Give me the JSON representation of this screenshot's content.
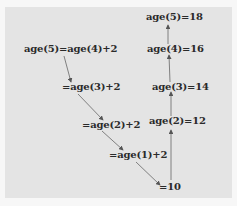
{
  "diagram": {
    "title": "",
    "left_chain": [
      {
        "id": "l1",
        "text": "age(5)=age(4)+2"
      },
      {
        "id": "l2",
        "text": "=age(3)+2"
      },
      {
        "id": "l3",
        "text": "=age(2)+2"
      },
      {
        "id": "l4",
        "text": "=age(1)+2"
      },
      {
        "id": "base",
        "text": "=10"
      }
    ],
    "right_chain": [
      {
        "id": "r2",
        "text": "age(2)=12"
      },
      {
        "id": "r3",
        "text": "age(3)=14"
      },
      {
        "id": "r4",
        "text": "age(4)=16"
      },
      {
        "id": "r5",
        "text": "age(5)=18"
      }
    ],
    "colors": {
      "background": "#e4e4e4",
      "text": "#2a2a2a",
      "arrow": "#555555"
    }
  }
}
